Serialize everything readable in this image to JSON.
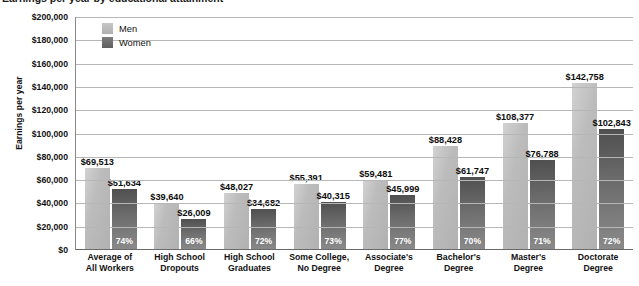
{
  "chart_data": {
    "type": "bar",
    "title": "Earnings per year by educational attainment",
    "xlabel": "",
    "ylabel": "Earnings per year",
    "ylim": [
      0,
      200000
    ],
    "ytick_step": 20000,
    "ytick_labels": [
      "$200,000",
      "$180,000",
      "$160,000",
      "$140,000",
      "$120,000",
      "$100,000",
      "$80,000",
      "$60,000",
      "$40,000",
      "$20,000",
      "$0"
    ],
    "grid": true,
    "legend_position": "top-left-inside",
    "categories": [
      "Average of All Workers",
      "High School Dropouts",
      "High School Graduates",
      "Some College, No Degree",
      "Associate's Degree",
      "Bachelor's Degree",
      "Master's Degree",
      "Doctorate Degree"
    ],
    "category_lines": [
      [
        "Average of",
        "All Workers"
      ],
      [
        "High School",
        "Dropouts"
      ],
      [
        "High School",
        "Graduates"
      ],
      [
        "Some College,",
        "No Degree"
      ],
      [
        "Associate's",
        "Degree"
      ],
      [
        "Bachelor's",
        "Degree"
      ],
      [
        "Master's",
        "Degree"
      ],
      [
        "Doctorate",
        "Degree"
      ]
    ],
    "series": [
      {
        "name": "Men",
        "color": "#b8b8b8",
        "values": [
          69513,
          39640,
          48027,
          55391,
          59481,
          88428,
          108377,
          142758
        ],
        "labels": [
          "$69,513",
          "$39,640",
          "$48,027",
          "$55,391",
          "$59,481",
          "$88,428",
          "$108,377",
          "$142,758"
        ]
      },
      {
        "name": "Women",
        "color": "#6e6e6e",
        "values": [
          51634,
          26009,
          34682,
          40315,
          45999,
          61747,
          76788,
          102843
        ],
        "labels": [
          "$51,634",
          "$26,009",
          "$34,682",
          "$40,315",
          "$45,999",
          "$61,747",
          "$76,788",
          "$102,843"
        ],
        "ratio_labels": [
          "74%",
          "66%",
          "72%",
          "73%",
          "77%",
          "70%",
          "71%",
          "72%"
        ]
      }
    ]
  },
  "legend": {
    "items": [
      {
        "label": "Men"
      },
      {
        "label": "Women"
      }
    ]
  }
}
